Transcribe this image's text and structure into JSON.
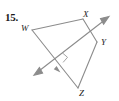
{
  "figure": {
    "problem_number": "15.",
    "kind": "geometry-diagram",
    "stroke_color": "#8c8c8c",
    "label_color": "#1c1c1c",
    "background": "#ffffff"
  },
  "vertices": [
    {
      "name": "W",
      "label": "W",
      "x": 32,
      "y": 30
    },
    {
      "name": "X",
      "label": "X",
      "x": 83,
      "y": 19
    },
    {
      "name": "Y",
      "label": "Y",
      "x": 97,
      "y": 42
    },
    {
      "name": "Z",
      "label": "Z",
      "x": 78,
      "y": 88
    }
  ],
  "sides": [
    {
      "from": "W",
      "to": "X"
    },
    {
      "from": "X",
      "to": "Y"
    },
    {
      "from": "Y",
      "to": "Z"
    },
    {
      "from": "Z",
      "to": "W"
    }
  ],
  "transversal": {
    "name": "double-arrow-line",
    "from_x": 35,
    "from_y": 74,
    "to_x": 109,
    "to_y": 17,
    "arrows": "both",
    "crosses": "WZ"
  },
  "markers": [
    {
      "name": "right-angle-mark",
      "at_x": 60,
      "at_y": 58
    },
    {
      "name": "single-tick-arrow-WZ",
      "at_x": 58,
      "at_y": 70
    }
  ]
}
